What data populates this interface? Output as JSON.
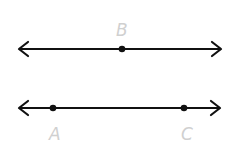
{
  "diagram": {
    "colors": {
      "line": "#111111",
      "label": "#d0d0d0",
      "background": "#ffffff"
    },
    "lines": [
      {
        "id": "top-line",
        "y": 49,
        "x1": 18,
        "x2": 221,
        "points": [
          {
            "label": "B",
            "x": 122,
            "label_pos": "above"
          }
        ]
      },
      {
        "id": "bottom-line",
        "y": 108,
        "x1": 18,
        "x2": 221,
        "points": [
          {
            "label": "A",
            "x": 53,
            "label_pos": "below"
          },
          {
            "label": "C",
            "x": 184,
            "label_pos": "below"
          }
        ]
      }
    ]
  }
}
